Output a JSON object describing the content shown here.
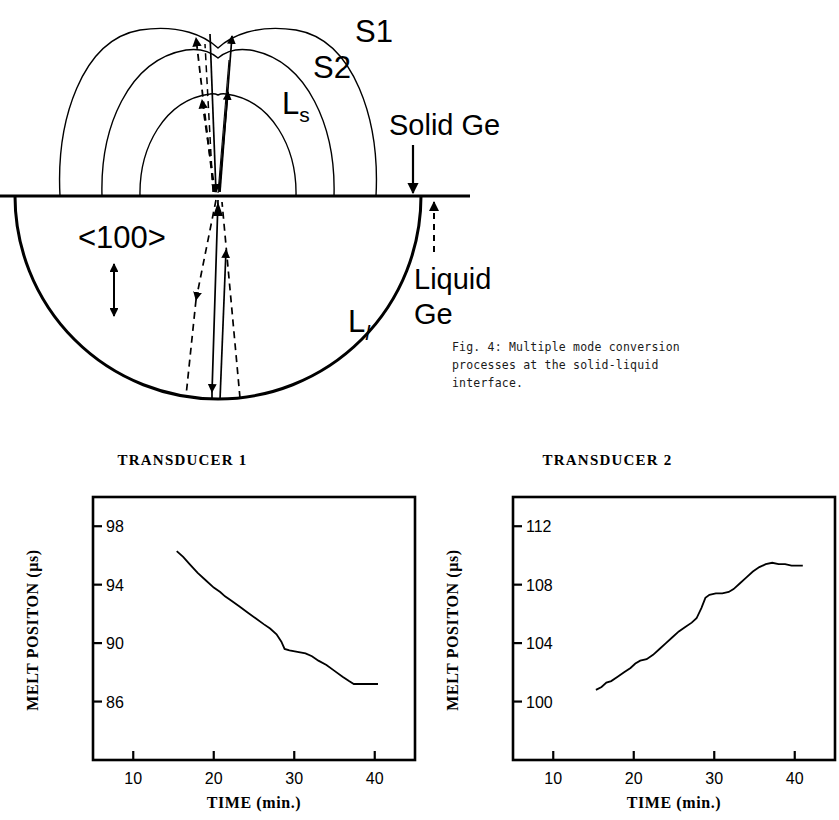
{
  "figure": {
    "caption": "Fig. 4:  Multiple mode conversion\nprocesses at the solid-liquid\ninterface."
  },
  "diagram": {
    "labels": {
      "s1": "S1",
      "s2": "S2",
      "ls_base": "L",
      "ls_sub": "s",
      "ll_base": "L",
      "ll_sub": "l",
      "solid_ge": "Solid Ge",
      "liquid_ge_line1": "Liquid",
      "liquid_ge_line2": "Ge",
      "orientation": "<100>"
    },
    "colors": {
      "stroke": "#000000",
      "background": "#ffffff"
    }
  },
  "chart_data": [
    {
      "type": "line",
      "title": "TRANSDUCER 1",
      "xlabel": "TIME (min.)",
      "ylabel": "MELT POSITON (µs)",
      "xlim": [
        5,
        45
      ],
      "ylim": [
        82,
        100
      ],
      "xticks": [
        10,
        20,
        30,
        40
      ],
      "yticks": [
        86,
        90,
        94,
        98
      ],
      "grid": false,
      "legend": null,
      "x": [
        15.4,
        16.2,
        17.0,
        18.0,
        19.0,
        20.0,
        20.8,
        21.4,
        22.2,
        23.2,
        24.2,
        25.2,
        26.2,
        27.0,
        27.8,
        28.4,
        28.8,
        29.4,
        30.4,
        31.4,
        32.2,
        33.0,
        34.0,
        35.0,
        36.0,
        36.8,
        37.4,
        38.4,
        39.4,
        40.4
      ],
      "y": [
        96.3,
        95.9,
        95.4,
        94.8,
        94.3,
        93.8,
        93.5,
        93.2,
        92.9,
        92.5,
        92.1,
        91.7,
        91.3,
        91.0,
        90.6,
        90.1,
        89.6,
        89.5,
        89.4,
        89.3,
        89.1,
        88.8,
        88.5,
        88.1,
        87.7,
        87.4,
        87.2,
        87.2,
        87.2,
        87.2
      ]
    },
    {
      "type": "line",
      "title": "TRANSDUCER 2",
      "xlabel": "TIME (min.)",
      "ylabel": "MELT POSITON (µs)",
      "xlim": [
        5,
        45
      ],
      "ylim": [
        96,
        114
      ],
      "xticks": [
        10,
        20,
        30,
        40
      ],
      "yticks": [
        100,
        104,
        108,
        112
      ],
      "grid": false,
      "legend": null,
      "x": [
        15.3,
        16.0,
        16.6,
        17.2,
        18.0,
        18.8,
        19.6,
        20.2,
        20.8,
        21.6,
        22.4,
        23.2,
        24.0,
        24.8,
        25.6,
        26.4,
        27.2,
        27.8,
        28.4,
        28.9,
        29.4,
        30.2,
        31.0,
        31.8,
        32.4,
        33.2,
        34.0,
        34.8,
        35.6,
        36.4,
        37.2,
        38.0,
        38.8,
        39.6,
        40.4,
        41.0
      ],
      "y": [
        100.8,
        101.0,
        101.3,
        101.4,
        101.7,
        102.0,
        102.3,
        102.6,
        102.8,
        102.9,
        103.2,
        103.6,
        104.0,
        104.4,
        104.8,
        105.1,
        105.4,
        105.7,
        106.4,
        107.1,
        107.3,
        107.4,
        107.4,
        107.5,
        107.7,
        108.1,
        108.5,
        108.9,
        109.2,
        109.4,
        109.5,
        109.4,
        109.4,
        109.3,
        109.3,
        109.3
      ]
    }
  ]
}
